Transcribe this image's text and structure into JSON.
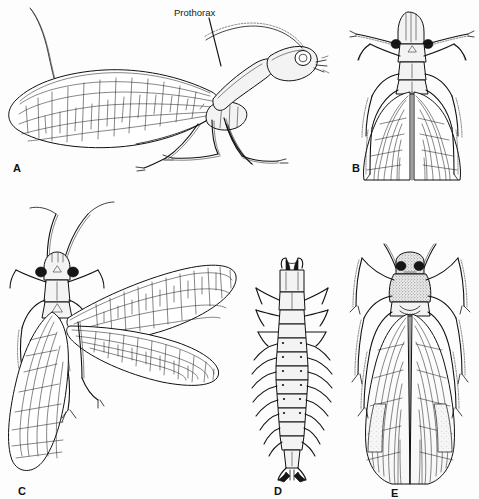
{
  "figure": {
    "background_color": "#fdfdfd",
    "ink_color": "#111111",
    "style": "black-and-white scientific line drawing",
    "width": 479,
    "height": 499
  },
  "callouts": [
    {
      "id": "prothorax",
      "text": "Prothorax",
      "x": 174,
      "y": 8,
      "leader": {
        "x1": 209,
        "y1": 18,
        "x2": 221,
        "y2": 66
      }
    }
  ],
  "panels": [
    {
      "id": "A",
      "letter": "A",
      "letter_x": 13,
      "letter_y": 163,
      "view": "lateral",
      "subject": "adult snakefly, side view with elongated prothorax, long antenna and folded forewing",
      "bbox": [
        5,
        5,
        345,
        180
      ]
    },
    {
      "id": "B",
      "letter": "B",
      "letter_x": 352,
      "letter_y": 163,
      "view": "dorsal",
      "subject": "adult with wings folded over abdomen, antennae spread forward",
      "bbox": [
        352,
        5,
        127,
        180
      ]
    },
    {
      "id": "C",
      "letter": "C",
      "letter_x": 18,
      "letter_y": 486,
      "view": "dorsal",
      "subject": "adult with wings spread to the right showing full venation",
      "bbox": [
        5,
        195,
        240,
        300
      ]
    },
    {
      "id": "D",
      "letter": "D",
      "letter_x": 274,
      "letter_y": 486,
      "view": "dorsal",
      "subject": "larva with segmented abdomen and lateral filaments",
      "bbox": [
        255,
        255,
        75,
        230
      ]
    },
    {
      "id": "E",
      "letter": "E",
      "letter_x": 391,
      "letter_y": 488,
      "view": "dorsal",
      "subject": "adult with stippled head and pronotum, wings folded, legs extended",
      "bbox": [
        345,
        258,
        130,
        232
      ]
    }
  ]
}
